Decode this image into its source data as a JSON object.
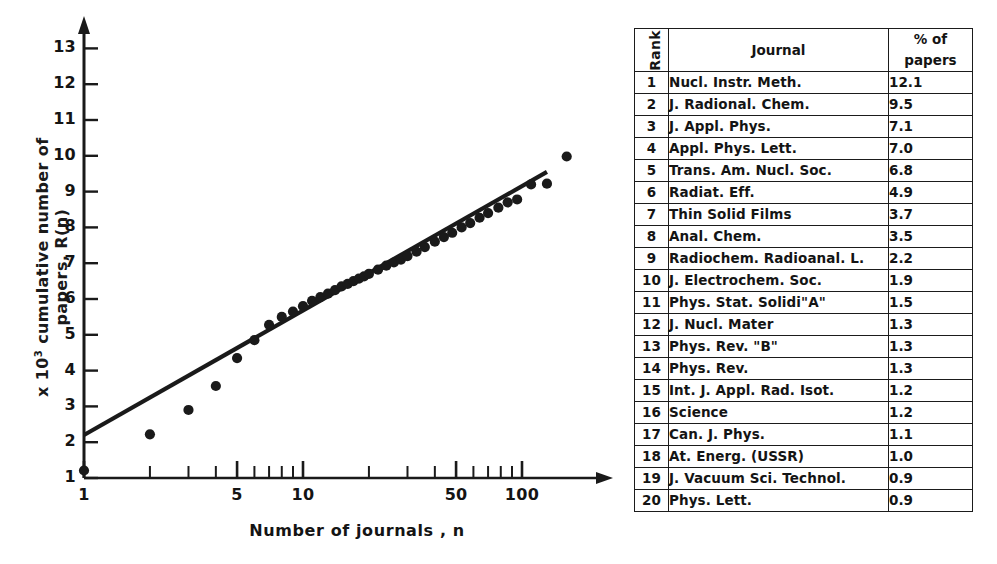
{
  "figure": {
    "y_axis_title_prefix": "x 10",
    "y_axis_title_exponent": "3",
    "y_axis_title_rest": " cumulative number of papers, R(n)",
    "x_axis_title": "Number of journals , n",
    "y_ticks": [
      "1",
      "2",
      "3",
      "4",
      "5",
      "6",
      "7",
      "8",
      "9",
      "10",
      "11",
      "12",
      "13"
    ],
    "x_tick_labels": [
      "1",
      "5",
      "10",
      "50",
      "100"
    ]
  },
  "chart_data": {
    "type": "scatter",
    "title": "",
    "xlabel": "Number of journals , n",
    "ylabel": "x 10^3 cumulative number of papers, R(n)",
    "xscale": "log",
    "yscale": "linear",
    "xlim": [
      1,
      200
    ],
    "ylim": [
      1,
      13
    ],
    "grid": false,
    "legend": null,
    "x_ticks_labeled": [
      1,
      5,
      10,
      50,
      100
    ],
    "y_ticks_labeled": [
      1,
      2,
      3,
      4,
      5,
      6,
      7,
      8,
      9,
      10,
      11,
      12,
      13
    ],
    "series": [
      {
        "name": "Cumulative papers (Bradford plot)",
        "marker": "filled-circle",
        "x": [
          1,
          2,
          3,
          4,
          5,
          6,
          7,
          8,
          9,
          10,
          11,
          12,
          13,
          14,
          15,
          16,
          17,
          18,
          19,
          20,
          22,
          24,
          26,
          28,
          30,
          33,
          36,
          40,
          44,
          48,
          53,
          58,
          64,
          70,
          78,
          86,
          95,
          110,
          130,
          160
        ],
        "y": [
          1.21,
          2.22,
          2.9,
          3.57,
          4.35,
          4.85,
          5.28,
          5.5,
          5.65,
          5.8,
          5.95,
          6.05,
          6.15,
          6.25,
          6.35,
          6.42,
          6.5,
          6.57,
          6.63,
          6.7,
          6.82,
          6.93,
          7.02,
          7.1,
          7.2,
          7.32,
          7.45,
          7.6,
          7.73,
          7.85,
          8.0,
          8.12,
          8.27,
          8.4,
          8.55,
          8.7,
          8.78,
          9.2,
          9.22,
          9.98
        ]
      },
      {
        "name": "Fitted Bradford line",
        "marker": "line",
        "x": [
          1,
          130
        ],
        "y": [
          2.2,
          9.55
        ]
      }
    ]
  },
  "table": {
    "headers": {
      "rank": "Rank",
      "journal": "Journal",
      "percent_line1": "% of",
      "percent_line2": "papers"
    },
    "rows": [
      {
        "rank": "1",
        "journal": "Nucl. Instr. Meth.",
        "percent": "12.1"
      },
      {
        "rank": "2",
        "journal": "J. Radional. Chem.",
        "percent": "9.5"
      },
      {
        "rank": "3",
        "journal": "J. Appl. Phys.",
        "percent": "7.1"
      },
      {
        "rank": "4",
        "journal": "Appl. Phys. Lett.",
        "percent": "7.0"
      },
      {
        "rank": "5",
        "journal": "Trans. Am. Nucl. Soc.",
        "percent": "6.8"
      },
      {
        "rank": "6",
        "journal": "Radiat. Eff.",
        "percent": "4.9"
      },
      {
        "rank": "7",
        "journal": "Thin Solid Films",
        "percent": "3.7"
      },
      {
        "rank": "8",
        "journal": "Anal. Chem.",
        "percent": "3.5"
      },
      {
        "rank": "9",
        "journal": "Radiochem. Radioanal. L.",
        "percent": "2.2"
      },
      {
        "rank": "10",
        "journal": "J. Electrochem. Soc.",
        "percent": "1.9"
      },
      {
        "rank": "11",
        "journal": "Phys. Stat. Solidi\"A\"",
        "percent": "1.5"
      },
      {
        "rank": "12",
        "journal": "J. Nucl. Mater",
        "percent": "1.3"
      },
      {
        "rank": "13",
        "journal": "Phys. Rev. \"B\"",
        "percent": "1.3"
      },
      {
        "rank": "14",
        "journal": "Phys. Rev.",
        "percent": "1.3"
      },
      {
        "rank": "15",
        "journal": "Int. J. Appl. Rad. Isot.",
        "percent": "1.2"
      },
      {
        "rank": "16",
        "journal": "Science",
        "percent": "1.2"
      },
      {
        "rank": "17",
        "journal": "Can. J. Phys.",
        "percent": "1.1"
      },
      {
        "rank": "18",
        "journal": "At. Energ. (USSR)",
        "percent": "1.0"
      },
      {
        "rank": "19",
        "journal": "J. Vacuum Sci. Technol.",
        "percent": "0.9"
      },
      {
        "rank": "20",
        "journal": "Phys. Lett.",
        "percent": "0.9"
      }
    ]
  },
  "colors": {
    "ink": "#1a1a1a",
    "background": "#ffffff"
  }
}
